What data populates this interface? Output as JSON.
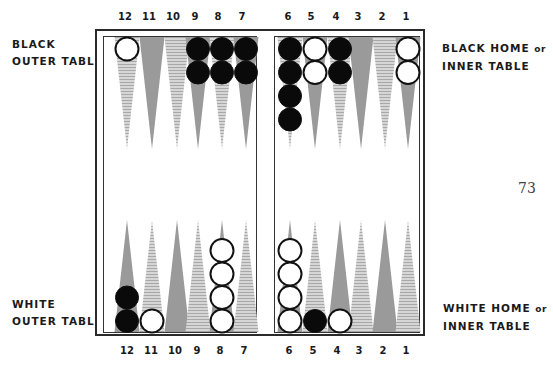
{
  "page_number": "73",
  "labels": {
    "black_outer": [
      "BLACK",
      "OUTER TABLE"
    ],
    "black_home": [
      "BLACK HOME",
      "or",
      "INNER TABLE"
    ],
    "white_outer": [
      "WHITE",
      "OUTER TABLE"
    ],
    "white_home": [
      "WHITE HOME",
      "or",
      "INNER TABLE"
    ]
  },
  "point_numbers_top": [
    "12",
    "11",
    "10",
    "9",
    "8",
    "7",
    "6",
    "5",
    "4",
    "3",
    "2",
    "1"
  ],
  "point_numbers_bottom": [
    "12",
    "11",
    "10",
    "9",
    "8",
    "7",
    "6",
    "5",
    "4",
    "3",
    "2",
    "1"
  ],
  "colors": {
    "dark_point": "#9a9a9a",
    "light_point": "#c8c8c8",
    "black_checker": "#0a0a0a",
    "white_checker": "#ffffff",
    "frame": "#2a2a2a"
  },
  "board": {
    "top_row": [
      {
        "point": "12",
        "checkers": [
          "white"
        ]
      },
      {
        "point": "11",
        "checkers": []
      },
      {
        "point": "10",
        "checkers": []
      },
      {
        "point": "9",
        "checkers": [
          "black",
          "black"
        ]
      },
      {
        "point": "8",
        "checkers": [
          "black",
          "black"
        ]
      },
      {
        "point": "7",
        "checkers": [
          "black",
          "black"
        ]
      },
      {
        "point": "6",
        "checkers": [
          "black",
          "black",
          "black",
          "black"
        ]
      },
      {
        "point": "5",
        "checkers": [
          "white",
          "white"
        ]
      },
      {
        "point": "4",
        "checkers": [
          "black",
          "black"
        ]
      },
      {
        "point": "3",
        "checkers": []
      },
      {
        "point": "2",
        "checkers": []
      },
      {
        "point": "1",
        "checkers": [
          "white",
          "white"
        ]
      }
    ],
    "bottom_row": [
      {
        "point": "12",
        "checkers": [
          "black",
          "black"
        ]
      },
      {
        "point": "11",
        "checkers": [
          "white"
        ]
      },
      {
        "point": "10",
        "checkers": []
      },
      {
        "point": "9",
        "checkers": []
      },
      {
        "point": "8",
        "checkers": [
          "white",
          "white",
          "white",
          "white"
        ]
      },
      {
        "point": "7",
        "checkers": []
      },
      {
        "point": "6",
        "checkers": [
          "white",
          "white",
          "white",
          "white"
        ]
      },
      {
        "point": "5",
        "checkers": [
          "black"
        ]
      },
      {
        "point": "4",
        "checkers": [
          "white"
        ]
      },
      {
        "point": "3",
        "checkers": []
      },
      {
        "point": "2",
        "checkers": []
      },
      {
        "point": "1",
        "checkers": []
      }
    ]
  }
}
